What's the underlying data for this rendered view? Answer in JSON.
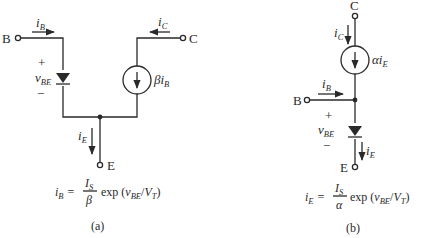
{
  "diagram": {
    "a": {
      "caption": "(a)",
      "terminals": {
        "base": "B",
        "collector": "C",
        "emitter": "E"
      },
      "currents": {
        "base": {
          "sym": "i",
          "sub": "B"
        },
        "collector": {
          "sym": "i",
          "sub": "C"
        },
        "emitter": {
          "sym": "i",
          "sub": "E"
        }
      },
      "voltage": {
        "plus": "+",
        "sym": "v",
        "sub": "BE",
        "minus": "−"
      },
      "source_label": {
        "coef": "β",
        "sym": "i",
        "sub": "B"
      },
      "equation": {
        "lhs_sym": "i",
        "lhs_sub": "B",
        "eq": "=",
        "num_sym": "I",
        "num_sub": "S",
        "den": "β",
        "fn": "exp (",
        "arg_sym": "v",
        "arg_sub": "BE",
        "slash": "/",
        "vt_sym": "V",
        "vt_sub": "T",
        "close": ")"
      }
    },
    "b": {
      "caption": "(b)",
      "terminals": {
        "base": "B",
        "collector": "C",
        "emitter": "E"
      },
      "currents": {
        "base": {
          "sym": "i",
          "sub": "B"
        },
        "collector": {
          "sym": "i",
          "sub": "C"
        },
        "emitter": {
          "sym": "i",
          "sub": "E"
        }
      },
      "voltage": {
        "plus": "+",
        "sym": "v",
        "sub": "BE",
        "minus": "−"
      },
      "source_label": {
        "coef": "α",
        "sym": "i",
        "sub": "E"
      },
      "equation": {
        "lhs_sym": "i",
        "lhs_sub": "E",
        "eq": "=",
        "num_sym": "I",
        "num_sub": "S",
        "den": "α",
        "fn": "exp (",
        "arg_sym": "v",
        "arg_sub": "BE",
        "slash": "/",
        "vt_sym": "V",
        "vt_sub": "T",
        "close": ")"
      }
    }
  }
}
